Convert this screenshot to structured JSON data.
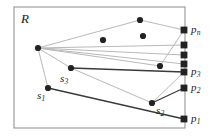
{
  "figure": {
    "region_label": "R",
    "colors": {
      "frame": "#8a8a8a",
      "light_edge": "#b9b9b9",
      "dark_edge": "#3a3a3a",
      "node_fill": "#222222",
      "text": "#1a1a1a",
      "background": "#ffffff"
    },
    "frame": {
      "x": 14,
      "y": 7,
      "width": 171,
      "height": 121
    },
    "labels": {
      "region": {
        "text": "R",
        "x": 21,
        "y": 12
      },
      "s1": {
        "base": "s",
        "sub": "1",
        "x": 37,
        "y": 93
      },
      "s2": {
        "base": "s",
        "sub": "2",
        "x": 155,
        "y": 108
      },
      "s3": {
        "base": "s",
        "sub": "3",
        "x": 60,
        "y": 77
      },
      "p1": {
        "base": "p",
        "sub": "1",
        "x": 190,
        "y": 115
      },
      "p2": {
        "base": "p",
        "sub": "2",
        "x": 190,
        "y": 84
      },
      "p3": {
        "base": "p",
        "sub": "3",
        "x": 190,
        "y": 68
      },
      "pn": {
        "base": "p",
        "sub": "n",
        "x": 190,
        "y": 26
      }
    },
    "sites": [
      {
        "name": "s1",
        "x": 48,
        "y": 88
      },
      {
        "name": "s2",
        "x": 152,
        "y": 103
      },
      {
        "name": "s3",
        "x": 71,
        "y": 68
      }
    ],
    "boundary_points": [
      {
        "name": "p1",
        "x": 184,
        "y": 119
      },
      {
        "name": "p2",
        "x": 184,
        "y": 88
      },
      {
        "name": "p3",
        "x": 184,
        "y": 72
      },
      {
        "name": "pu1",
        "x": 184,
        "y": 64
      },
      {
        "name": "pu2",
        "x": 184,
        "y": 55
      },
      {
        "name": "pu3",
        "x": 184,
        "y": 45
      },
      {
        "name": "pn",
        "x": 184,
        "y": 30
      }
    ],
    "interior_nodes": [
      {
        "name": "node-left-vertex",
        "x": 38,
        "y": 48
      },
      {
        "name": "node-top",
        "x": 140,
        "y": 20
      },
      {
        "name": "node-mid-left",
        "x": 103,
        "y": 40
      },
      {
        "name": "node-mid-right",
        "x": 143,
        "y": 36
      },
      {
        "name": "node-lower-right",
        "x": 160,
        "y": 66
      }
    ],
    "light_edges": [
      {
        "name": "edge-leftvertex-top",
        "x1": 38,
        "y1": 48,
        "x2": 140,
        "y2": 20
      },
      {
        "name": "edge-top-pn",
        "x1": 140,
        "y1": 20,
        "x2": 184,
        "y2": 30
      },
      {
        "name": "edge-leftvertex-lowerright",
        "x1": 38,
        "y1": 48,
        "x2": 160,
        "y2": 66
      },
      {
        "name": "edge-lowerright-pn",
        "x1": 160,
        "y1": 66,
        "x2": 184,
        "y2": 30
      },
      {
        "name": "edge-leftvertex-s3",
        "x1": 38,
        "y1": 48,
        "x2": 71,
        "y2": 68
      },
      {
        "name": "edge-leftvertex-s1",
        "x1": 38,
        "y1": 48,
        "x2": 48,
        "y2": 88
      },
      {
        "name": "edge-leftvertex-pu1",
        "x1": 38,
        "y1": 48,
        "x2": 184,
        "y2": 64
      },
      {
        "name": "edge-leftvertex-pu2",
        "x1": 38,
        "y1": 48,
        "x2": 184,
        "y2": 55
      },
      {
        "name": "edge-leftvertex-pu3",
        "x1": 38,
        "y1": 48,
        "x2": 184,
        "y2": 45
      },
      {
        "name": "edge-s3-s2",
        "x1": 71,
        "y1": 68,
        "x2": 152,
        "y2": 103
      },
      {
        "name": "edge-s2-p3",
        "x1": 152,
        "y1": 103,
        "x2": 184,
        "y2": 72
      }
    ],
    "dark_edges": [
      {
        "name": "edge-s3-p3",
        "x1": 71,
        "y1": 68,
        "x2": 184,
        "y2": 72
      },
      {
        "name": "edge-s2-p2",
        "x1": 152,
        "y1": 103,
        "x2": 184,
        "y2": 88
      },
      {
        "name": "edge-s1-p1",
        "x1": 48,
        "y1": 88,
        "x2": 184,
        "y2": 119
      }
    ]
  }
}
